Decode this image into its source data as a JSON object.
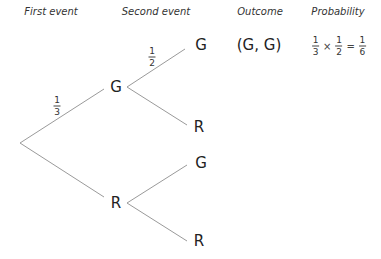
{
  "headers": {
    "first_event": "First event",
    "second_event": "Second event",
    "outcome": "Outcome",
    "probability": "Probability"
  },
  "tree": {
    "first_level": [
      {
        "label": "G",
        "prob_num": "1",
        "prob_den": "3"
      },
      {
        "label": "R"
      }
    ],
    "second_level_from_G": [
      {
        "label": "G",
        "prob_num": "1",
        "prob_den": "2"
      },
      {
        "label": "R"
      }
    ],
    "second_level_from_R": [
      {
        "label": "G"
      },
      {
        "label": "R"
      }
    ]
  },
  "outcomes": [
    {
      "outcome": "(G, G)",
      "probability": {
        "a_num": "1",
        "a_den": "3",
        "op": "×",
        "b_num": "1",
        "b_den": "2",
        "eq": "=",
        "c_num": "1",
        "c_den": "6"
      }
    }
  ],
  "colors": {
    "line": "#9a9a9a",
    "text": "#222222"
  }
}
